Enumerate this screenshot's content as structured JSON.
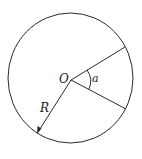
{
  "diagram": {
    "type": "circle-sector",
    "labels": {
      "center": "O",
      "angle": "a",
      "radius": "R"
    },
    "colors": {
      "stroke": "#2a2a2a",
      "background": "#ffffff"
    }
  }
}
